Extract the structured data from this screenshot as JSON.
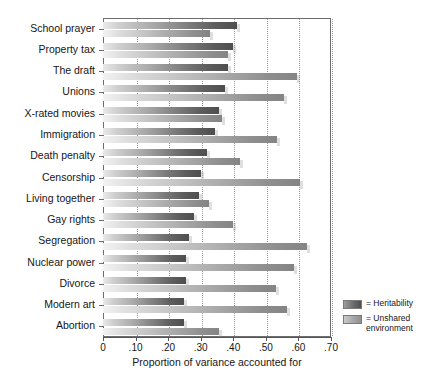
{
  "chart_data": {
    "type": "bar",
    "orientation": "horizontal",
    "title": "",
    "xlabel": "Proportion of variance accounted for",
    "ylabel": "",
    "xlim": [
      0,
      0.7
    ],
    "xticks": [
      0,
      0.1,
      0.2,
      0.3,
      0.4,
      0.5,
      0.6,
      0.7
    ],
    "xtick_labels": [
      "0",
      ".10",
      ".20",
      ".30",
      ".40",
      ".50",
      ".60",
      ".70"
    ],
    "grid": "vertical-dotted",
    "legend_position": "right-bottom",
    "categories": [
      "School prayer",
      "Property tax",
      "The draft",
      "Unions",
      "X-rated movies",
      "Immigration",
      "Death penalty",
      "Censorship",
      "Living together",
      "Gay rights",
      "Segregation",
      "Nuclear power",
      "Divorce",
      "Modern art",
      "Abortion"
    ],
    "series": [
      {
        "name": "Heritability",
        "color": "#4e4e4e",
        "values": [
          0.41,
          0.4,
          0.385,
          0.375,
          0.355,
          0.345,
          0.32,
          0.3,
          0.295,
          0.28,
          0.265,
          0.255,
          0.255,
          0.25,
          0.25
        ]
      },
      {
        "name": "Unshared environment",
        "color": "#8e8e8e",
        "values": [
          0.33,
          0.385,
          0.595,
          0.555,
          0.365,
          0.535,
          0.42,
          0.605,
          0.325,
          0.4,
          0.625,
          0.585,
          0.53,
          0.565,
          0.355
        ]
      }
    ]
  },
  "legend": {
    "items": [
      {
        "prefix": "= ",
        "label": "Heritability",
        "swatch": "heritability"
      },
      {
        "prefix": "= ",
        "label": "Unshared environment",
        "swatch": "unshared"
      }
    ]
  }
}
